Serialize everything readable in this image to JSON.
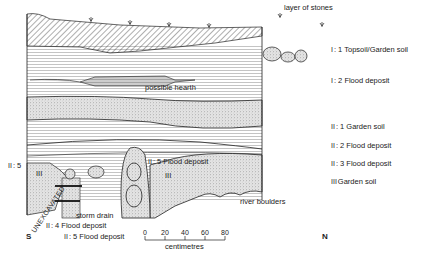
{
  "figure": {
    "type": "stratigraphic section",
    "orientation": {
      "left": "S",
      "right": "N"
    }
  },
  "annotations": {
    "layer_of_stones": "layer of stones",
    "possible_hearth": "possible hearth",
    "river_boulders": "river boulders",
    "storm_drain": "storm drain",
    "unexcavated": "UNEXCAVATED"
  },
  "legend": [
    {
      "symbol": "I",
      "label": ": 1 Topsoil/Garden soil"
    },
    {
      "symbol": "I",
      "label": ": 2 Flood deposit"
    },
    {
      "symbol": "II",
      "label": ": 1 Garden soil"
    },
    {
      "symbol": "II",
      "label": ": 2 Flood deposit"
    },
    {
      "symbol": "II",
      "label": ": 3 Flood deposit"
    },
    {
      "symbol": "III",
      "label": "Garden soil"
    }
  ],
  "inline_labels": {
    "left_5": {
      "symbol": "II",
      "label": ": 5"
    },
    "mid_5": {
      "symbol": "II",
      "label": ": 5 Flood deposit"
    },
    "bottom_4": {
      "symbol": "II",
      "label": ": 4 Flood deposit"
    },
    "bottom_5": {
      "symbol": "II",
      "label": ": 5 Flood deposit"
    },
    "roman_left": "III",
    "roman_mid": "III"
  },
  "scale": {
    "ticks": [
      "0",
      "20",
      "40",
      "60",
      "80"
    ],
    "unit": "centimetres"
  }
}
